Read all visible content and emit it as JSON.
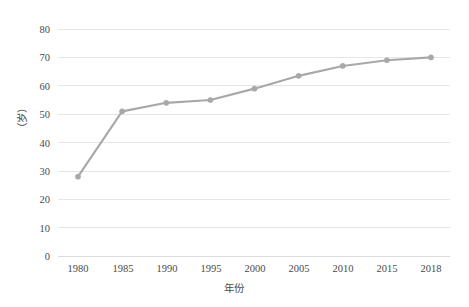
{
  "chart_data": {
    "type": "line",
    "title": "",
    "subtitle": "",
    "xlabel": "年份",
    "ylabel": "（岁）",
    "categories": [
      "1980",
      "1985",
      "1990",
      "1995",
      "2000",
      "2005",
      "2010",
      "2015",
      "2018"
    ],
    "x": [
      1980,
      1985,
      1990,
      1995,
      2000,
      2005,
      2010,
      2015,
      2018
    ],
    "values": [
      28,
      51,
      54,
      55,
      59,
      63.5,
      67,
      69,
      70
    ],
    "series": [
      {
        "name": "",
        "values": [
          28,
          51,
          54,
          55,
          59,
          63.5,
          67,
          69,
          70
        ]
      }
    ],
    "ylim": [
      0,
      80
    ],
    "yticks": [
      0,
      10,
      20,
      30,
      40,
      50,
      60,
      70,
      80
    ],
    "ytick_labels": [
      "0",
      "10",
      "20",
      "30",
      "40",
      "50",
      "60",
      "70",
      "80"
    ],
    "xtick_labels": [
      "1980",
      "1985",
      "1990",
      "1995",
      "2000",
      "2005",
      "2010",
      "2015",
      "2018"
    ],
    "grid": true,
    "grid_axis": "y",
    "legend": false,
    "legend_position": "none",
    "line_color": "#a8a8a8",
    "marker_color": "#a8a8a8",
    "grid_color": "#e4e6e8",
    "background_color": "#ffffff",
    "text_color": "#4a4a4a",
    "marker": "circle",
    "annotations": []
  },
  "axes": {
    "y_title": "（岁）",
    "x_title": "年份"
  }
}
